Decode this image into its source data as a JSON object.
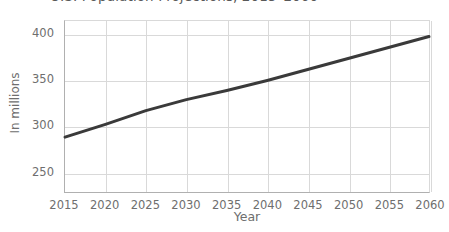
{
  "chart_data": {
    "type": "line",
    "title": "U.S. Population Projections, 2015–2060",
    "title_clipped": true,
    "xlabel": "Year",
    "ylabel": "In millions",
    "x": [
      2015,
      2020,
      2025,
      2030,
      2035,
      2040,
      2045,
      2050,
      2055,
      2060
    ],
    "series": [
      {
        "name": "Projected U.S. population",
        "values": [
          288,
          302,
          317,
          329,
          339,
          350,
          362,
          374,
          386,
          398
        ],
        "color": "#3a3a3a",
        "line_width": 3
      }
    ],
    "xlim": [
      2015,
      2060
    ],
    "ylim": [
      228,
      415
    ],
    "xticks": [
      "2015",
      "2020",
      "2025",
      "2030",
      "2035",
      "2040",
      "2045",
      "2050",
      "2055",
      "2060"
    ],
    "yticks": [
      "250",
      "300",
      "350",
      "400"
    ],
    "ytick_values": [
      250,
      300,
      350,
      400
    ],
    "grid": true,
    "legend": false,
    "legend_position": "none",
    "background_color": "#ffffff",
    "grid_color": "#d9d9d9",
    "axis_color": "#b0b0b0",
    "tick_label_color": "#6e6e6e"
  }
}
